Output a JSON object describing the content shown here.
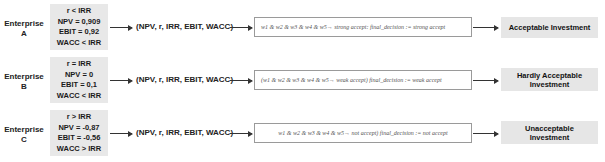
{
  "diagram": {
    "tuple_label": "(NPV, r, IRR, EBIT, WACC)",
    "rows": [
      {
        "enterprise": "Enterprise",
        "letter": "A",
        "conditions": [
          "r < IRR",
          "NPV = 0,909",
          "EBIT = 0,92",
          "WACC < IRR"
        ],
        "formula": "w1 & w2 & w3 & w4 & w5→ strong accept: final_decision := strong accept",
        "outcome": "Acceptable Investment"
      },
      {
        "enterprise": "Enterprise",
        "letter": "B",
        "conditions": [
          "r = IRR",
          "NPV = 0",
          "EBIT = 0,1",
          "WACC < IRR"
        ],
        "formula": "(w1 & w2 & w3 & w4 & w5→ weak accept) final_decision := weak accept",
        "outcome": "Hardly Acceptable Investment"
      },
      {
        "enterprise": "Enterprise",
        "letter": "C",
        "conditions": [
          "r > IRR",
          "NPV = -0,87",
          "EBIT = -0,56",
          "WACC > IRR"
        ],
        "formula": "w1 & w2 & w3 & w4 & w5→ not accept) final_decision := not accept",
        "outcome": "Unacceptable Investment"
      }
    ]
  }
}
